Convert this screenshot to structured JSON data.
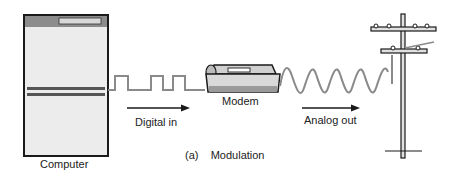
{
  "diagram": {
    "caption": "(a)    Modulation",
    "nodes": {
      "computer": {
        "label": "Computer"
      },
      "modem": {
        "label": "Modem"
      },
      "pole": {
        "label": ""
      }
    },
    "signals": {
      "digital": {
        "label": "Digital in",
        "type": "square-wave"
      },
      "analog": {
        "label": "Analog out",
        "type": "sine-wave"
      }
    },
    "colors": {
      "outline": "#1a1a1a",
      "fill": "#e6e6e6",
      "wave": "#8a8a8a",
      "dark_bar": "#555555"
    }
  }
}
